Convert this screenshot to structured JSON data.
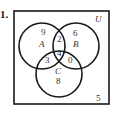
{
  "problem": {
    "number": "1."
  },
  "diagram": {
    "type": "venn-3",
    "universe_label": "U",
    "sets": [
      {
        "name": "A",
        "label": "A"
      },
      {
        "name": "B",
        "label": "B"
      },
      {
        "name": "C",
        "label": "C"
      }
    ],
    "regions": {
      "A_only": "9",
      "B_only": "6",
      "C_only": "8",
      "A_and_B_only": "2",
      "A_and_C_only": "3",
      "B_and_C_only": "0",
      "A_and_B_and_C": "4",
      "outside": "5"
    },
    "colors": {
      "stroke": "#1a1a1a",
      "text": "#333333",
      "background": "#ffffff"
    }
  }
}
